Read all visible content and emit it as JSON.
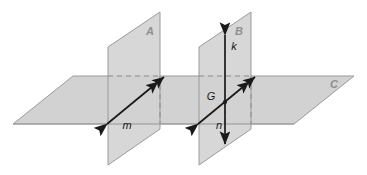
{
  "figure": {
    "background_color": "#ffffff"
  },
  "colors": {
    "plane_fill": "#d2d2d2",
    "plane_fill_overlap": "#c6c6c6",
    "plane_edge": "#9a9a9a",
    "hidden_edge": "#9a9a9a",
    "line_color": "#1a1a1a",
    "plane_label_color": "#8f8f8f",
    "line_label_color": "#1a1a1a"
  },
  "planes": [
    {
      "id": "plane-a",
      "label": "A",
      "label_x": 150,
      "label_y": 35,
      "points": "108,47 160,12 160,129 108,165",
      "description": "left vertical plane"
    },
    {
      "id": "plane-b",
      "label": "B",
      "label_x": 239,
      "label_y": 35,
      "points": "199,47 251,12 251,129 199,165",
      "description": "right vertical plane"
    },
    {
      "id": "plane-c",
      "label": "C",
      "label_x": 334,
      "label_y": 88,
      "points": "13,124 73,76 354,76 294,124",
      "description": "horizontal plane"
    }
  ],
  "lines": [
    {
      "id": "line-m",
      "label": "m",
      "label_x": 127,
      "label_y": 125,
      "x1": 107,
      "y1": 124,
      "x2": 164,
      "y2": 77,
      "arrow_start": "single",
      "arrow_end": "double",
      "description": "line m in plane A"
    },
    {
      "id": "line-n",
      "label": "n",
      "label_x": 219,
      "label_y": 125,
      "x1": 198,
      "y1": 124,
      "x2": 255,
      "y2": 77,
      "arrow_start": "single",
      "arrow_end": "double",
      "description": "line n in plane B"
    },
    {
      "id": "line-k",
      "label": "k",
      "label_x": 232,
      "label_y": 48,
      "x1": 225,
      "y1": 35,
      "x2": 225,
      "y2": 144,
      "arrow_start": "single",
      "arrow_end": "single",
      "description": "vertical line k in plane B"
    }
  ],
  "points": [
    {
      "id": "point-g",
      "label": "G",
      "x": 225,
      "y": 102,
      "label_x": 210,
      "label_y": 99,
      "description": "intersection of line n and line k"
    }
  ],
  "hidden_edges": [
    {
      "id": "hidden-a-top",
      "x1": 108,
      "y1": 76,
      "x2": 160,
      "y2": 76
    },
    {
      "id": "hidden-a-back",
      "x1": 160,
      "y1": 76,
      "x2": 160,
      "y2": 124
    },
    {
      "id": "hidden-b-top",
      "x1": 199,
      "y1": 76,
      "x2": 251,
      "y2": 76
    },
    {
      "id": "hidden-b-back",
      "x1": 251,
      "y1": 76,
      "x2": 251,
      "y2": 124
    },
    {
      "id": "hidden-k-lower",
      "x1": 225,
      "y1": 102,
      "x2": 225,
      "y2": 124
    }
  ]
}
